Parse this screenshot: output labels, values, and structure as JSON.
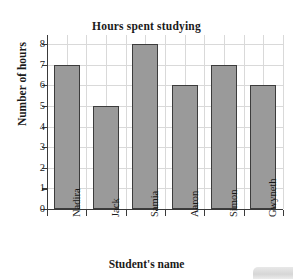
{
  "chart_data": {
    "type": "bar",
    "title": "Hours spent studying",
    "xlabel": "Student's name",
    "ylabel": "Number of hours",
    "categories": [
      "Nadira",
      "Jack",
      "Samia",
      "Aaron",
      "Simon",
      "Gwyneth"
    ],
    "values": [
      7,
      5,
      8,
      6,
      7,
      6
    ],
    "ylim": [
      0,
      8
    ],
    "yticks": [
      0,
      1,
      2,
      3,
      4,
      5,
      6,
      7,
      8
    ],
    "ytick_labels": [
      "0",
      "1",
      "2",
      "3",
      "4",
      "5",
      "6",
      "7",
      "8"
    ],
    "grid": true,
    "legend": false,
    "bar_color": "#9a9a9a",
    "bar_edge_color": "#3c3c3c",
    "grid_color": "#d9d9d9",
    "axis_color": "#3a3a3a",
    "background": "#ffffff"
  }
}
